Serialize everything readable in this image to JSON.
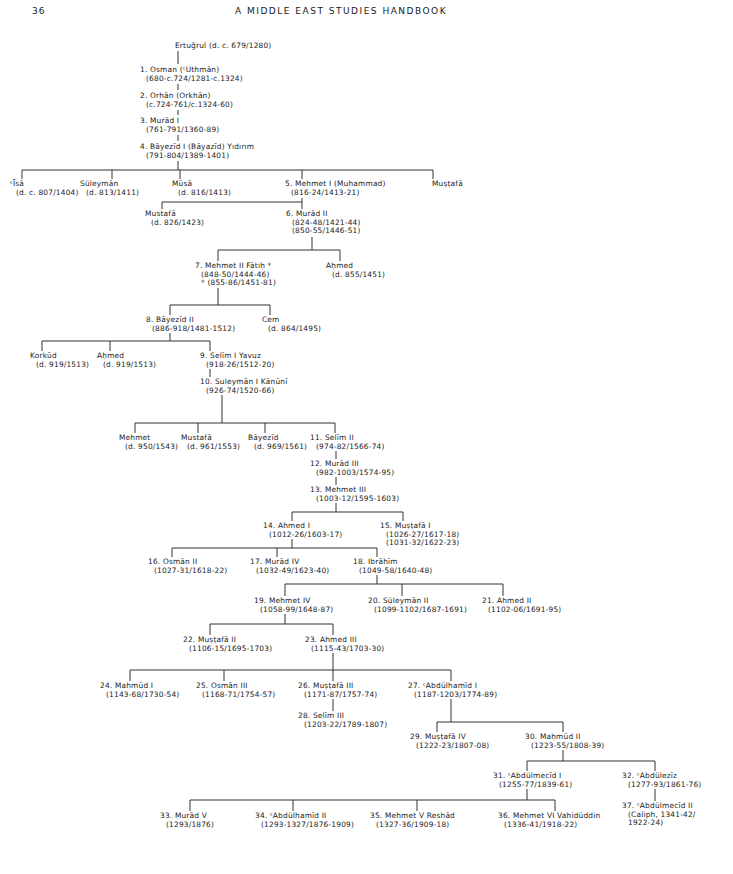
{
  "header": {
    "page_number": "36",
    "running_title": "A MIDDLE EAST STUDIES HANDBOOK"
  },
  "diagram": {
    "type": "genealogical-tree",
    "nodes": [
      {
        "id": "ertugrul",
        "name": "Ertuğrul (d. c. 679/1280)",
        "dates": "",
        "x": 175,
        "y": 42
      },
      {
        "id": "s1",
        "name": "1. Osman (ᶜUthmān)",
        "dates": "(680-c.724/1281-c.1324)",
        "x": 140,
        "y": 66
      },
      {
        "id": "s2",
        "name": "2. Orhān (Orkhān)",
        "dates": "(c.724-761/c.1324-60)",
        "x": 140,
        "y": 92
      },
      {
        "id": "s3",
        "name": "3. Murād I",
        "dates": "(761-791/1360-89)",
        "x": 140,
        "y": 117
      },
      {
        "id": "s4",
        "name": "4. Bāyezīd I (Bāyazīd) Yıdırım",
        "dates": "(791-804/1389-1401)",
        "x": 140,
        "y": 143
      },
      {
        "id": "isa",
        "name": "ᶜĪsā",
        "dates": "(d. c. 807/1404)",
        "x": 10,
        "y": 180
      },
      {
        "id": "suleyman_c",
        "name": "Süleymān",
        "dates": "(d. 813/1411)",
        "x": 80,
        "y": 180
      },
      {
        "id": "musa",
        "name": "Mūsā",
        "dates": "(d. 816/1413)",
        "x": 172,
        "y": 180
      },
      {
        "id": "s5",
        "name": "5. Mehmet I (Muhammad)",
        "dates": "(816-24/1413-21)",
        "x": 285,
        "y": 180
      },
      {
        "id": "mustafa_c1",
        "name": "Muṣṭafā",
        "dates": "",
        "x": 432,
        "y": 180
      },
      {
        "id": "mustafa_c2",
        "name": "Mustafā",
        "dates": "(d. 826/1423)",
        "x": 145,
        "y": 210
      },
      {
        "id": "s6",
        "name": "6. Murād II",
        "dates": "(824-48/1421-44)",
        "dates2": "(850-55/1446-51)",
        "x": 286,
        "y": 210
      },
      {
        "id": "s7",
        "name": "7. Mehmet II Fātiḥ *",
        "dates": "(848-50/1444-46)",
        "dates2": "* (855-86/1451-81)",
        "x": 195,
        "y": 262
      },
      {
        "id": "ahmed_c1",
        "name": "Aḥmed",
        "dates": "(d. 855/1451)",
        "x": 326,
        "y": 262
      },
      {
        "id": "s8",
        "name": "8. Bāyezīd II",
        "dates": "(886-918/1481-1512)",
        "x": 146,
        "y": 316
      },
      {
        "id": "cem",
        "name": "Cem",
        "dates": "(d. 864/1495)",
        "x": 262,
        "y": 316
      },
      {
        "id": "korkud",
        "name": "Korkūd",
        "dates": "(d. 919/1513)",
        "x": 30,
        "y": 352
      },
      {
        "id": "ahmed_c2",
        "name": "Aḥmed",
        "dates": "(d. 919/1513)",
        "x": 97,
        "y": 352
      },
      {
        "id": "s9",
        "name": "9. Selīm I Yavuz",
        "dates": "(918-26/1512-20)",
        "x": 200,
        "y": 352
      },
      {
        "id": "s10",
        "name": "10. Suleymān I Kānūnī",
        "dates": "(926-74/1520-66)",
        "x": 200,
        "y": 378
      },
      {
        "id": "mehmet_c",
        "name": "Mehmet",
        "dates": "(d. 950/1543)",
        "x": 119,
        "y": 434
      },
      {
        "id": "mustafa_c3",
        "name": "Mustafā",
        "dates": "(d. 961/1553)",
        "x": 181,
        "y": 434
      },
      {
        "id": "bayezid_c",
        "name": "Bāyezīd",
        "dates": "(d. 969/1561)",
        "x": 248,
        "y": 434
      },
      {
        "id": "s11",
        "name": "11. Selīm II",
        "dates": "(974-82/1566-74)",
        "x": 310,
        "y": 434
      },
      {
        "id": "s12",
        "name": "12. Murād III",
        "dates": "(982-1003/1574-95)",
        "x": 310,
        "y": 460
      },
      {
        "id": "s13",
        "name": "13. Mehmet III",
        "dates": "(1003-12/1595-1603)",
        "x": 310,
        "y": 486
      },
      {
        "id": "s14",
        "name": "14. Ahmed I",
        "dates": "(1012-26/1603-17)",
        "x": 263,
        "y": 522
      },
      {
        "id": "s15",
        "name": "15. Muṣṭafā I",
        "dates": "(1026-27/1617-18)",
        "dates2": "(1031-32/1622-23)",
        "x": 380,
        "y": 522
      },
      {
        "id": "s16",
        "name": "16. Osmān II",
        "dates": "(1027-31/1618-22)",
        "x": 148,
        "y": 558
      },
      {
        "id": "s17",
        "name": "17. Murād IV",
        "dates": "(1032-49/1623-40)",
        "x": 250,
        "y": 558
      },
      {
        "id": "s18",
        "name": "18. Ibrāhīm",
        "dates": "(1049-58/1640-48)",
        "x": 353,
        "y": 558
      },
      {
        "id": "s19",
        "name": "19. Mehmet IV",
        "dates": "(1058-99/1648-87)",
        "x": 254,
        "y": 597
      },
      {
        "id": "s20",
        "name": "20. Süleymān II",
        "dates": "(1099-1102/1687-1691)",
        "x": 368,
        "y": 597
      },
      {
        "id": "s21",
        "name": "21. Ahmed II",
        "dates": "(1102-06/1691-95)",
        "x": 482,
        "y": 597
      },
      {
        "id": "s22",
        "name": "22. Muṣṭafā II",
        "dates": "(1106-15/1695-1703)",
        "x": 183,
        "y": 636
      },
      {
        "id": "s23",
        "name": "23. Ahmed III",
        "dates": "(1115-43/1703-30)",
        "x": 305,
        "y": 636
      },
      {
        "id": "s24",
        "name": "24. Mahmūd I",
        "dates": "(1143-68/1730-54)",
        "x": 100,
        "y": 682
      },
      {
        "id": "s25",
        "name": "25. Osmān III",
        "dates": "(1168-71/1754-57)",
        "x": 196,
        "y": 682
      },
      {
        "id": "s26",
        "name": "26. Muṣṭafā III",
        "dates": "(1171-87/1757-74)",
        "x": 298,
        "y": 682
      },
      {
        "id": "s27",
        "name": "27. ᶜAbdülhamīd I",
        "dates": "(1187-1203/1774-89)",
        "x": 408,
        "y": 682
      },
      {
        "id": "s28",
        "name": "28. Selīm III",
        "dates": "(1203-22/1789-1807)",
        "x": 298,
        "y": 712
      },
      {
        "id": "s29",
        "name": "29. Muṣṭafā IV",
        "dates": "(1222-23/1807-08)",
        "x": 410,
        "y": 733
      },
      {
        "id": "s30",
        "name": "30. Maḥmūd II",
        "dates": "(1223-55/1808-39)",
        "x": 525,
        "y": 733
      },
      {
        "id": "s31",
        "name": "31. ᶜAbdülmecīd I",
        "dates": "(1255-77/1839-61)",
        "x": 493,
        "y": 772
      },
      {
        "id": "s32",
        "name": "32. ᶜAbdülezīz",
        "dates": "(1277-93/1861-76)",
        "x": 622,
        "y": 772
      },
      {
        "id": "s37",
        "name": "37. ᶜAbdülmecīd II",
        "dates": "(Caliph, 1341-42/",
        "dates2": "1922-24)",
        "x": 622,
        "y": 802
      },
      {
        "id": "s33",
        "name": "33. Murād V",
        "dates": "(1293/1876)",
        "x": 160,
        "y": 812
      },
      {
        "id": "s34",
        "name": "34. ᶜAbdülhamīd II",
        "dates": "(1293-1327/1876-1909)",
        "x": 255,
        "y": 812
      },
      {
        "id": "s35",
        "name": "35. Mehmet V Reshād",
        "dates": "(1327-36/1909-18)",
        "x": 370,
        "y": 812
      },
      {
        "id": "s36",
        "name": "36. Mehmet VI Vahidüddin",
        "dates": "(1336-41/1918-22)",
        "x": 498,
        "y": 812
      }
    ]
  }
}
